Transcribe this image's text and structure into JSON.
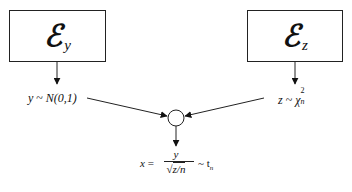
{
  "diagram": {
    "nodes": {
      "source_y": {
        "symbol": "ℰ",
        "subscript": "y"
      },
      "source_z": {
        "symbol": "ℰ",
        "subscript": "z"
      },
      "combiner": {
        "shape": "circle"
      }
    },
    "labels": {
      "y_dist": {
        "var": "y",
        "tilde": " ~ ",
        "dist": "N(0,1)"
      },
      "z_dist": {
        "var": "z",
        "tilde": " ~ ",
        "dist": "χ",
        "sup": "2",
        "sub": "n"
      },
      "output": {
        "lhs": "x",
        "equals": " = ",
        "numerator": "y",
        "denominator": "z/n",
        "radical": "√",
        "tilde": "~ t",
        "sub": "n"
      }
    },
    "edges": [
      {
        "from": "source_y",
        "to": "y_dist"
      },
      {
        "from": "source_z",
        "to": "z_dist"
      },
      {
        "from": "y_dist",
        "to": "combiner"
      },
      {
        "from": "z_dist",
        "to": "combiner"
      },
      {
        "from": "combiner",
        "to": "output"
      }
    ],
    "caption_cutoff": "(text clipped at bottom edge)"
  },
  "colors": {
    "stroke": "#222222",
    "background": "#ffffff"
  }
}
